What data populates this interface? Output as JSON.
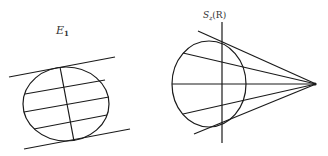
{
  "figures": [
    {
      "id": "left",
      "label": "E",
      "label_sub": "1",
      "description": "Ellipse between two parallel tangent lines, with conjugate diameter and parallel chords"
    },
    {
      "id": "right",
      "label": "S",
      "label_sub": "z",
      "label_suffix": "(R)",
      "description": "Circle with vertical line and pencil of lines from an external point"
    }
  ],
  "colors": {
    "stroke": "#1a1a1a",
    "background": "#ffffff"
  }
}
